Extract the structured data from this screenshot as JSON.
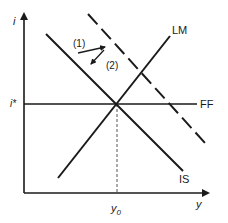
{
  "diagram": {
    "type": "IS-LM-FF economics diagram",
    "axes": {
      "y_axis_label": "i",
      "x_axis_label": "y"
    },
    "levels": {
      "interest_rate_label": "i*",
      "output_label": "y",
      "output_sub": "0"
    },
    "curves": {
      "is_label": "IS",
      "lm_label": "LM",
      "ff_label": "FF",
      "shifted_is": "dashed IS (shifted right)"
    },
    "arrows": {
      "arrow1_label": "(1)",
      "arrow2_label": "(2)"
    },
    "colors": {
      "line": "#1a1a1a",
      "dashed_guide": "#555555",
      "background": "#ffffff"
    }
  }
}
